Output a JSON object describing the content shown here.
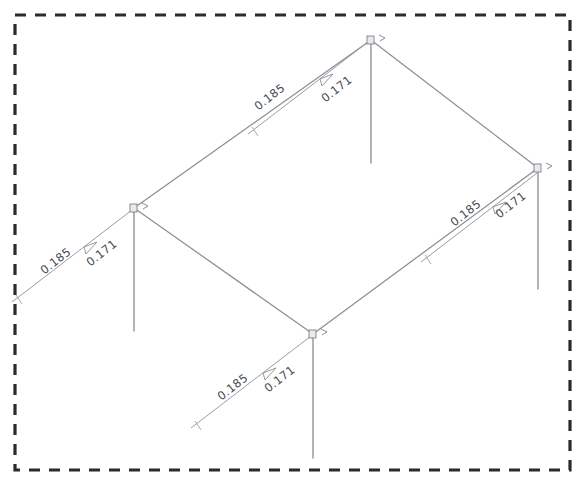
{
  "diagram": {
    "type": "isometric-frame",
    "background_color": "#ffffff",
    "member_color": "#8c8f95",
    "border_color": "#2b2b2b",
    "label_color": "#4a4d52",
    "border": {
      "style": "dashed",
      "x": 15,
      "y": 15,
      "width": 555,
      "height": 455
    },
    "nodes": [
      {
        "id": "top",
        "label": "joint-top",
        "x": 371,
        "y": 40
      },
      {
        "id": "right",
        "label": "joint-right",
        "x": 538,
        "y": 168
      },
      {
        "id": "left",
        "label": "joint-left",
        "x": 134,
        "y": 208
      },
      {
        "id": "bottom",
        "label": "joint-bottom",
        "x": 313,
        "y": 334
      }
    ],
    "beams": [
      {
        "id": "beam-left-top",
        "from": "left",
        "to": "top"
      },
      {
        "id": "beam-top-right",
        "from": "top",
        "to": "right"
      },
      {
        "id": "beam-left-bottom",
        "from": "left",
        "to": "bottom"
      },
      {
        "id": "beam-bottom-right",
        "from": "bottom",
        "to": "right"
      }
    ],
    "columns": [
      {
        "id": "column-top",
        "x": 371,
        "y_top": 40,
        "y_bottom": 163
      },
      {
        "id": "column-right",
        "x": 538,
        "y_top": 168,
        "y_bottom": 289
      },
      {
        "id": "column-left",
        "x": 134,
        "y_top": 208,
        "y_bottom": 331
      },
      {
        "id": "column-bottom",
        "x": 313,
        "y_top": 334,
        "y_bottom": 458
      }
    ],
    "loads": [
      {
        "id": "load-top",
        "at_node": "top",
        "value_a": "0.185",
        "value_b": "0.171",
        "direction": "toward-joint",
        "angle_deg": -37.5
      },
      {
        "id": "load-right",
        "at_node": "right",
        "value_a": "0.185",
        "value_b": "0.171",
        "direction": "toward-joint",
        "angle_deg": -37.5
      },
      {
        "id": "load-left",
        "at_node": "left",
        "value_a": "0.185",
        "value_b": "0.171",
        "direction": "toward-joint",
        "angle_deg": -37.5
      },
      {
        "id": "load-bottom",
        "at_node": "bottom",
        "value_a": "0.185",
        "value_b": "0.171",
        "direction": "toward-joint",
        "angle_deg": -37.5
      }
    ]
  }
}
